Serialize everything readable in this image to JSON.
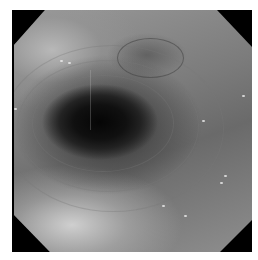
{
  "image": {
    "description": "Grayscale endoscopic view of a tubular lumen with a dark central opening, concentric mucosal folds, and octagonal black vignette corners",
    "colors": {
      "lumen": "#050505",
      "mucosa_mid": "#7c7c7c",
      "mucosa_light": "#cfcfcf",
      "vignette": "#000000",
      "background": "#ffffff"
    }
  }
}
